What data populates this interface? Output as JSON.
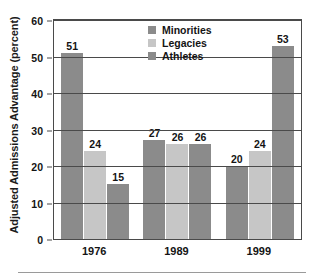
{
  "chart_data": {
    "type": "bar",
    "title": "",
    "xlabel": "",
    "ylabel": "Adjusted Admissions Advantage (percent)",
    "categories": [
      "1976",
      "1989",
      "1999"
    ],
    "series": [
      {
        "name": "Minorities",
        "values": [
          51,
          24,
          15
        ],
        "color": "#8b8b8b"
      },
      {
        "name": "Legacies",
        "values": [
          27,
          26,
          26
        ],
        "color": "#c6c6c6"
      },
      {
        "name": "Athletes",
        "values": [
          20,
          24,
          53
        ],
        "color": "#8b8b8b"
      }
    ],
    "groups": [
      {
        "category": "1976",
        "bars": [
          {
            "series": "Minorities",
            "value": 51,
            "label": "51",
            "color": "#8b8b8b"
          },
          {
            "series": "Legacies",
            "value": 24,
            "label": "24",
            "color": "#c6c6c6"
          },
          {
            "series": "Athletes",
            "value": 15,
            "label": "15",
            "color": "#8b8b8b"
          }
        ]
      },
      {
        "category": "1989",
        "bars": [
          {
            "series": "Minorities",
            "value": 27,
            "label": "27",
            "color": "#8b8b8b"
          },
          {
            "series": "Legacies",
            "value": 26,
            "label": "26",
            "color": "#c6c6c6"
          },
          {
            "series": "Athletes",
            "value": 26,
            "label": "26",
            "color": "#8b8b8b"
          }
        ]
      },
      {
        "category": "1999",
        "bars": [
          {
            "series": "Minorities",
            "value": 20,
            "label": "20",
            "color": "#8b8b8b"
          },
          {
            "series": "Legacies",
            "value": 24,
            "label": "24",
            "color": "#c6c6c6"
          },
          {
            "series": "Athletes",
            "value": 53,
            "label": "53",
            "color": "#8b8b8b"
          }
        ]
      }
    ],
    "ylim": [
      0,
      60
    ],
    "yticks": [
      0,
      10,
      20,
      30,
      40,
      50,
      60
    ],
    "ytick_labels": [
      "0",
      "10",
      "20",
      "30",
      "40",
      "50",
      "60"
    ],
    "grid": true,
    "grid_axis": "y",
    "legend": {
      "position": "top-center",
      "entries": [
        {
          "label": "Minorities",
          "color": "#8b8b8b"
        },
        {
          "label": "Legacies",
          "color": "#c6c6c6"
        },
        {
          "label": "Athletes",
          "color": "#8b8b8b"
        }
      ]
    },
    "colors": {
      "minorities": "#8b8b8b",
      "legacies": "#c6c6c6",
      "athletes": "#8b8b8b",
      "axis": "#4a4a4a",
      "text": "#141414",
      "background": "#ffffff"
    }
  }
}
